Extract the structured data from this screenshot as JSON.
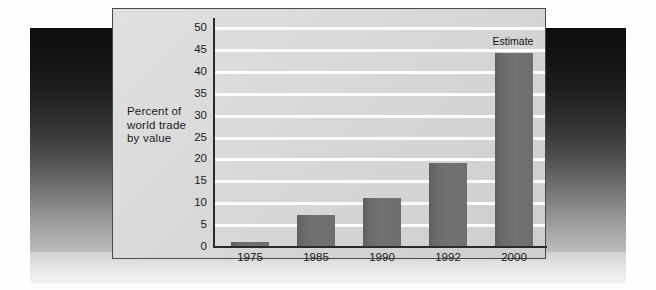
{
  "chart_data": {
    "type": "bar",
    "title": "",
    "subtitle": "",
    "xlabel": "",
    "ylabel": "Percent of world trade by value",
    "ylabel_lines": [
      "Percent of",
      "world trade",
      "by value"
    ],
    "categories": [
      "1975",
      "1985",
      "1990",
      "1992",
      "2000"
    ],
    "values": [
      1,
      7,
      11,
      19,
      44
    ],
    "ylim": [
      0,
      50
    ],
    "ytick_labels": [
      "0",
      "5",
      "10",
      "15",
      "20",
      "25",
      "30",
      "35",
      "40",
      "45",
      "50"
    ],
    "ytick_values": [
      0,
      5,
      10,
      15,
      20,
      25,
      30,
      35,
      40,
      45,
      50
    ],
    "grid": true,
    "grid_color": "#ffffff",
    "legend": "none",
    "annotations": [
      {
        "text": "Estimate",
        "category": "2000",
        "position": "above-bar"
      }
    ],
    "bar_color": "#6b6b6b",
    "plot_background": "#d6d6d6",
    "axis_color": "#2a2a2a"
  },
  "figure": {
    "panel_background": "#d6d6d6",
    "panel_border": "#4a4a4a",
    "backdrop_top_color": "#0d0d0d",
    "backdrop_bottom_color": "#d2d2d2",
    "page_background": "#fefefe"
  }
}
